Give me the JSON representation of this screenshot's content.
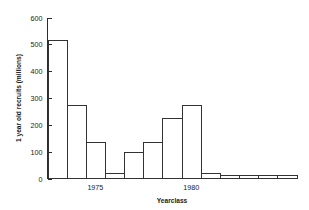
{
  "chart_data": {
    "type": "bar",
    "title": "",
    "xlabel": "Yearclass",
    "ylabel": "1 year old recruits (millions)",
    "categories": [
      1973,
      1974,
      1975,
      1976,
      1977,
      1978,
      1979,
      1980,
      1981,
      1982,
      1983,
      1984,
      1985
    ],
    "values": [
      515,
      275,
      135,
      20,
      100,
      135,
      225,
      275,
      20,
      12,
      12,
      12,
      12
    ],
    "xlim": [
      1972.5,
      1985.5
    ],
    "ylim": [
      0,
      600
    ],
    "yticks": [
      0,
      100,
      200,
      300,
      400,
      500,
      600
    ],
    "ytick_labels": [
      "0",
      "100",
      "200",
      "300",
      "400",
      "500",
      "600"
    ],
    "xticks": [
      1973,
      1974,
      1975,
      1976,
      1977,
      1978,
      1979,
      1980,
      1981,
      1982,
      1983,
      1984,
      1985
    ],
    "xtick_labels": [
      "",
      "",
      "1975",
      "",
      "",
      "",
      "",
      "1980",
      "",
      "",
      "",
      "",
      ""
    ],
    "labelled_xticks": [
      {
        "value": 1975,
        "label": "1975"
      },
      {
        "value": 1980,
        "label": "1980"
      }
    ],
    "grid": false,
    "legend": null,
    "bar_style": "outline",
    "bar_fill": "#ffffff",
    "bar_stroke": "#333333"
  },
  "figure": {
    "background": "#ffffff",
    "axis_color": "#2b2b2b",
    "text_color": "#1a1a1a"
  }
}
